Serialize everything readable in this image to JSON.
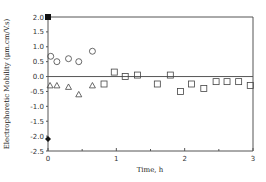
{
  "chart_data": {
    "type": "scatter",
    "title": "",
    "xlabel": "Time, h",
    "ylabel": "Electrophoretic Mobility (μm.cm/V.s)",
    "xlim": [
      0,
      3
    ],
    "ylim": [
      -2.5,
      2.0
    ],
    "x_ticks": [
      0,
      1,
      2,
      3
    ],
    "x_tick_labels": [
      "0",
      "1",
      "2",
      "3"
    ],
    "y_ticks": [
      2.0,
      1.5,
      1.0,
      0.5,
      0.0,
      -0.5,
      -1.0,
      -1.5,
      -2.0,
      -2.5
    ],
    "y_tick_labels": [
      "2.0",
      "1.5",
      "1.0",
      "0.5",
      "0.0",
      "-0.5",
      "-1.0",
      "-1.5",
      "-2.0",
      "-2.5"
    ],
    "grid": false,
    "reference_lines": [
      0.0,
      2.0
    ],
    "series": [
      {
        "name": "filled-square",
        "marker": "square-filled",
        "points": [
          [
            0,
            2.0
          ]
        ]
      },
      {
        "name": "filled-diamond",
        "marker": "diamond-filled",
        "points": [
          [
            0,
            -2.1
          ]
        ]
      },
      {
        "name": "circles",
        "marker": "circle-open",
        "points": [
          [
            0.04,
            0.68
          ],
          [
            0.13,
            0.5
          ],
          [
            0.3,
            0.6
          ],
          [
            0.45,
            0.5
          ],
          [
            0.65,
            0.85
          ]
        ]
      },
      {
        "name": "triangles",
        "marker": "triangle-open",
        "points": [
          [
            0.03,
            -0.3
          ],
          [
            0.13,
            -0.3
          ],
          [
            0.3,
            -0.35
          ],
          [
            0.45,
            -0.6
          ],
          [
            0.65,
            -0.3
          ]
        ]
      },
      {
        "name": "squares",
        "marker": "square-open",
        "points": [
          [
            0.82,
            -0.25
          ],
          [
            0.97,
            0.15
          ],
          [
            1.13,
            0.0
          ],
          [
            1.31,
            0.05
          ],
          [
            1.6,
            -0.25
          ],
          [
            1.79,
            0.05
          ],
          [
            1.94,
            -0.5
          ],
          [
            2.1,
            -0.25
          ],
          [
            2.28,
            -0.4
          ],
          [
            2.46,
            -0.17
          ],
          [
            2.62,
            -0.17
          ],
          [
            2.79,
            -0.17
          ],
          [
            2.96,
            -0.3
          ]
        ]
      }
    ]
  }
}
